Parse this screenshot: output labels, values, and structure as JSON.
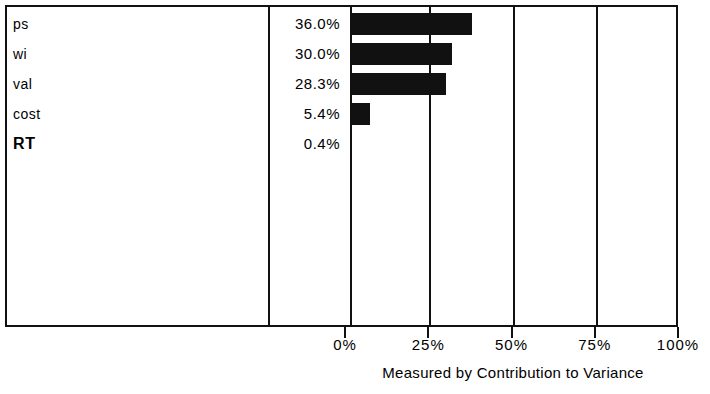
{
  "chart_data": {
    "type": "bar",
    "orientation": "horizontal",
    "title": "",
    "xlabel": "Measured by Contribution to Variance",
    "ylabel": "",
    "xlim": [
      0,
      100
    ],
    "grid": true,
    "legend": null,
    "categories": [
      "ps",
      "wi",
      "val",
      "cost",
      "RT"
    ],
    "values": [
      36.0,
      30.0,
      28.3,
      5.4,
      0.4
    ],
    "value_labels": [
      "36.0%",
      "30.0%",
      "28.3%",
      "5.4%",
      "0.4%"
    ],
    "tick_labels": [
      "0%",
      "25%",
      "50%",
      "75%",
      "100%"
    ],
    "tick_values": [
      0,
      25,
      50,
      75,
      100
    ],
    "bar_color": "#111111",
    "emphasized_categories": [
      "RT"
    ]
  },
  "rows": [
    {
      "label": "ps",
      "value_label": "36.0%",
      "value": 36.0,
      "emphasis": false
    },
    {
      "label": "wi",
      "value_label": "30.0%",
      "value": 30.0,
      "emphasis": false
    },
    {
      "label": "val",
      "value_label": "28.3%",
      "value": 28.3,
      "emphasis": false
    },
    {
      "label": "cost",
      "value_label": "5.4%",
      "value": 5.4,
      "emphasis": false
    },
    {
      "label": "RT",
      "value_label": "0.4%",
      "value": 0.4,
      "emphasis": true
    }
  ],
  "axis": {
    "ticks": [
      {
        "label": "0%",
        "value": 0
      },
      {
        "label": "25%",
        "value": 25
      },
      {
        "label": "50%",
        "value": 50
      },
      {
        "label": "75%",
        "value": 75
      },
      {
        "label": "100%",
        "value": 100
      }
    ],
    "title": "Measured by Contribution to Variance"
  }
}
